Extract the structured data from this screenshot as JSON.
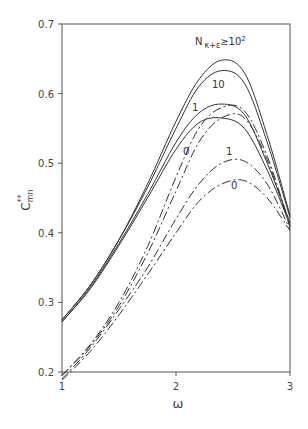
{
  "chart_data": {
    "type": "line",
    "title": "",
    "xlabel": "ω",
    "ylabel": "C**mn",
    "xlim": [
      1,
      3
    ],
    "ylim": [
      0.2,
      0.7
    ],
    "xticks": [
      "1",
      "2",
      "3"
    ],
    "yticks": [
      "0.2",
      "0.3",
      "0.4",
      "0.5",
      "0.6",
      "0.7"
    ],
    "grid": false,
    "legend": "inline curve labels",
    "annotations": [
      "N κ+ε ≥10²",
      "10",
      "1",
      "0",
      "1",
      "0"
    ],
    "x": [
      1.0,
      1.25,
      1.5,
      1.75,
      2.0,
      2.2,
      2.4,
      2.6,
      2.8,
      3.0
    ],
    "series": [
      {
        "name": "N≥10² (solid)",
        "style": "solid",
        "values": [
          0.275,
          0.325,
          0.39,
          0.47,
          0.56,
          0.62,
          0.648,
          0.63,
          0.54,
          0.425
        ]
      },
      {
        "name": "10 (solid)",
        "style": "solid",
        "values": [
          0.275,
          0.325,
          0.39,
          0.465,
          0.55,
          0.61,
          0.633,
          0.615,
          0.53,
          0.422
        ]
      },
      {
        "name": "1 (solid)",
        "style": "solid",
        "values": [
          0.272,
          0.322,
          0.385,
          0.455,
          0.53,
          0.572,
          0.585,
          0.57,
          0.5,
          0.415
        ]
      },
      {
        "name": "0 (solid)",
        "style": "solid",
        "values": [
          0.272,
          0.32,
          0.382,
          0.45,
          0.52,
          0.558,
          0.565,
          0.55,
          0.49,
          0.412
        ]
      },
      {
        "name": "1 (dash-dot, upper)",
        "style": "dashdot",
        "values": [
          0.195,
          0.24,
          0.3,
          0.38,
          0.48,
          0.55,
          0.58,
          0.575,
          0.51,
          0.41
        ]
      },
      {
        "name": "0 (dash-dot, upper)",
        "style": "dashdot",
        "values": [
          0.195,
          0.238,
          0.295,
          0.37,
          0.46,
          0.53,
          0.565,
          0.565,
          0.505,
          0.408
        ]
      },
      {
        "name": "1 (dash-dot, lower)",
        "style": "dashdot",
        "values": [
          0.19,
          0.235,
          0.29,
          0.35,
          0.42,
          0.47,
          0.5,
          0.503,
          0.47,
          0.405
        ]
      },
      {
        "name": "0 (dash-dot, lower)",
        "style": "dashdot",
        "values": [
          0.188,
          0.23,
          0.282,
          0.34,
          0.4,
          0.445,
          0.47,
          0.475,
          0.45,
          0.403
        ]
      }
    ]
  },
  "axis": {
    "x_label": "ω",
    "y_label_main": "C",
    "y_label_sup": "**",
    "y_label_sub": "mn"
  },
  "labels": {
    "top": "N",
    "top_sub": "κ+ε",
    "top_rest": "≥10",
    "top_exp": "2",
    "ten": "10",
    "one_solid": "1",
    "zero_solid": "0",
    "one_dash": "1",
    "zero_dash": "0"
  }
}
